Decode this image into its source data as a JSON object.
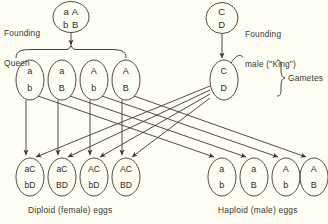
{
  "figure": {
    "background_color": "#fdfdf3",
    "ink_color": "#3a3830"
  },
  "labels": {
    "founding_queen_line1": "Founding",
    "founding_queen_line2": "Queen",
    "founding_male_line1": "Founding",
    "founding_male_line2": "male (\"King\")",
    "gametes": "Gametes",
    "diploid_caption": "Diploid (female) eggs",
    "haploid_caption": "Haploid (male) eggs"
  },
  "founders": {
    "queen": {
      "top": "a A",
      "bottom": "b B"
    },
    "king": {
      "top": "C",
      "bottom": "D"
    }
  },
  "gametes": {
    "female": [
      {
        "top": "a",
        "bottom": "b"
      },
      {
        "top": "a",
        "bottom": "B"
      },
      {
        "top": "A",
        "bottom": "b"
      },
      {
        "top": "A",
        "bottom": "B"
      }
    ],
    "male": {
      "top": "C",
      "bottom": "D"
    }
  },
  "eggs": {
    "diploid": [
      {
        "top": "aC",
        "bottom": "bD"
      },
      {
        "top": "aC",
        "bottom": "BD"
      },
      {
        "top": "AC",
        "bottom": "bD"
      },
      {
        "top": "AC",
        "bottom": "BD"
      }
    ],
    "haploid": [
      {
        "top": "a",
        "bottom": "b"
      },
      {
        "top": "a",
        "bottom": "B"
      },
      {
        "top": "A",
        "bottom": "b"
      },
      {
        "top": "A",
        "bottom": "B"
      }
    ]
  }
}
